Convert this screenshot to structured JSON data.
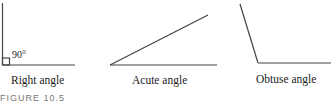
{
  "figure": {
    "angles": [
      {
        "name": "right",
        "label": "Right angle",
        "annotation": "90°"
      },
      {
        "name": "acute",
        "label": "Acute angle"
      },
      {
        "name": "obtuse",
        "label": "Obtuse angle"
      }
    ],
    "caption": "FIGURE 10.5",
    "line_color": "#444444"
  }
}
